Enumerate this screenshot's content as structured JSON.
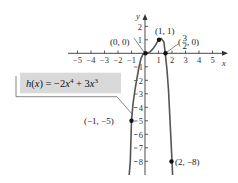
{
  "figure": {
    "function_label": "h(x) = −2x⁴ + 3x³",
    "function_label_parts": {
      "name": "h",
      "var": "x",
      "eq": " = −2",
      "exp1": "4",
      "plus": " + 3",
      "exp2": "3"
    },
    "axis_labels": {
      "x": "x",
      "y": "y"
    },
    "x_ticks": [
      "−5",
      "−4",
      "−3",
      "−2",
      "−1",
      "1",
      "2",
      "3",
      "4",
      "5"
    ],
    "y_ticks_pos": [
      "1",
      "2"
    ],
    "y_ticks_neg": [
      "1",
      "2",
      "3",
      "4",
      "5",
      "6",
      "7",
      "8"
    ],
    "points": [
      {
        "label": "(0, 0)",
        "x": 0,
        "y": 0
      },
      {
        "label": "(1, 1)",
        "x": 1,
        "y": 1
      },
      {
        "label": "(3/2, 0)",
        "x": 1.5,
        "y": 0
      },
      {
        "label": "(−1, −5)",
        "x": -1,
        "y": -5
      },
      {
        "label": "(2, −8)",
        "x": 2,
        "y": -8
      }
    ],
    "point_labels": {
      "origin": "(0, 0)",
      "max": "(1, 1)",
      "root_open": "(",
      "root_num": "3",
      "root_den": "2",
      "root_rest": ", 0)",
      "left": "(−1, −5)",
      "right": "(2, −8)"
    },
    "colors": {
      "curve": "#555555",
      "label_box": "#d9d9d9",
      "axis": "#333333"
    }
  }
}
